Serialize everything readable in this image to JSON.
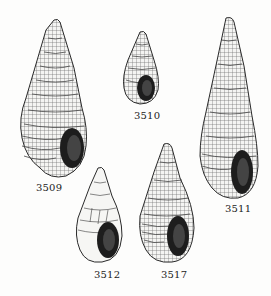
{
  "plate": {
    "background": "#fdfdfc",
    "ink": "#1c1c1c",
    "specimens": [
      {
        "id": "3509",
        "label": "3509"
      },
      {
        "id": "3510",
        "label": "3510"
      },
      {
        "id": "3511",
        "label": "3511"
      },
      {
        "id": "3512",
        "label": "3512"
      },
      {
        "id": "3517",
        "label": "3517"
      }
    ]
  }
}
